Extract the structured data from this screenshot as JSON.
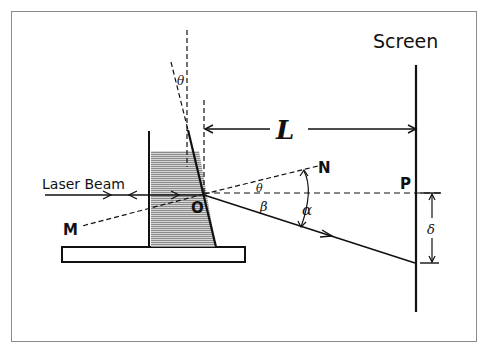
{
  "diagram": {
    "type": "optics-setup",
    "labels": {
      "screen": "Screen",
      "laser_beam": "Laser Beam",
      "distance": "L",
      "point_o": "O",
      "point_n": "N",
      "point_m": "M",
      "point_p": "P",
      "theta_top": "θ",
      "theta_mid": "θ",
      "beta": "β",
      "alpha": "α",
      "delta": "δ"
    },
    "colors": {
      "ink": "#111111",
      "liquid_fill": "#b8b8b8",
      "frame": "#8a8a8a"
    }
  }
}
